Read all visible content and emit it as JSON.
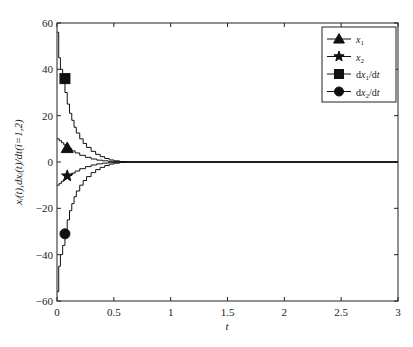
{
  "chart_data": {
    "type": "line",
    "title": "",
    "xlabel": "t",
    "ylabel": "x_i(t),dx_i(t)/dt(i=1,2)",
    "xlim": [
      0,
      3
    ],
    "ylim": [
      -60,
      60
    ],
    "xticks": [
      "0",
      "0.5",
      "1",
      "1.5",
      "2",
      "2.5",
      "3"
    ],
    "yticks": [
      "-60",
      "-40",
      "-20",
      "0",
      "20",
      "40",
      "60"
    ],
    "grid": false,
    "legend_position": "upper right",
    "series": [
      {
        "name": "x1",
        "label": "x₁",
        "marker": "triangle",
        "marker_at": [
          0.09,
          6
        ],
        "x": [
          0,
          0.02,
          0.04,
          0.06,
          0.08,
          0.1,
          0.13,
          0.16,
          0.2,
          0.25,
          0.3,
          0.35,
          0.4,
          0.45,
          0.5,
          0.55,
          0.6,
          3
        ],
        "y": [
          10,
          9.2,
          8.3,
          7.4,
          6.6,
          5.8,
          4.8,
          3.9,
          2.9,
          2.0,
          1.3,
          0.8,
          0.5,
          0.3,
          0.15,
          0.05,
          0,
          0
        ]
      },
      {
        "name": "x2",
        "label": "x₂",
        "marker": "star",
        "marker_at": [
          0.09,
          -6
        ],
        "x": [
          0,
          0.02,
          0.04,
          0.06,
          0.08,
          0.1,
          0.13,
          0.16,
          0.2,
          0.25,
          0.3,
          0.35,
          0.4,
          0.45,
          0.5,
          0.55,
          0.6,
          3
        ],
        "y": [
          -10,
          -9.2,
          -8.3,
          -7.4,
          -6.6,
          -5.8,
          -4.8,
          -3.9,
          -2.9,
          -2.0,
          -1.3,
          -0.8,
          -0.5,
          -0.3,
          -0.15,
          -0.05,
          0,
          0
        ]
      },
      {
        "name": "dx1/dt",
        "label": "dx₁/dt",
        "marker": "square",
        "marker_at": [
          0.07,
          36
        ],
        "x": [
          0,
          0.015,
          0.03,
          0.05,
          0.07,
          0.09,
          0.11,
          0.13,
          0.15,
          0.17,
          0.2,
          0.23,
          0.26,
          0.3,
          0.34,
          0.38,
          0.42,
          0.46,
          0.5,
          0.55,
          0.6,
          3
        ],
        "y": [
          56,
          45,
          40,
          36,
          30,
          25,
          21,
          18,
          15,
          12.5,
          10,
          8,
          6.3,
          4.6,
          3.3,
          2.3,
          1.5,
          0.9,
          0.5,
          0.2,
          0,
          0
        ]
      },
      {
        "name": "dx2/dt",
        "label": "dx₂/dt",
        "marker": "circle",
        "marker_at": [
          0.07,
          -31
        ],
        "x": [
          0,
          0.015,
          0.03,
          0.05,
          0.07,
          0.09,
          0.11,
          0.13,
          0.15,
          0.17,
          0.2,
          0.23,
          0.26,
          0.3,
          0.34,
          0.38,
          0.42,
          0.46,
          0.5,
          0.55,
          0.6,
          3
        ],
        "y": [
          -56,
          -45,
          -40,
          -36,
          -30,
          -25,
          -21,
          -18,
          -15,
          -12.5,
          -10,
          -8,
          -6.3,
          -4.6,
          -3.3,
          -2.3,
          -1.5,
          -0.9,
          -0.5,
          -0.2,
          0,
          0
        ]
      }
    ]
  },
  "axes": {
    "xlabel": "t",
    "ylabel": "xᵢ(t),dxᵢ(t)/dt(i=1,2)"
  },
  "legend": {
    "items": [
      {
        "label_main": "x",
        "label_sub": "1",
        "marker": "triangle"
      },
      {
        "label_main": "x",
        "label_sub": "2",
        "marker": "star"
      },
      {
        "label_main": "dx",
        "label_sub": "1",
        "label_tail": "/dt",
        "marker": "square"
      },
      {
        "label_main": "dx",
        "label_sub": "2",
        "label_tail": "/dt",
        "marker": "circle"
      }
    ]
  }
}
